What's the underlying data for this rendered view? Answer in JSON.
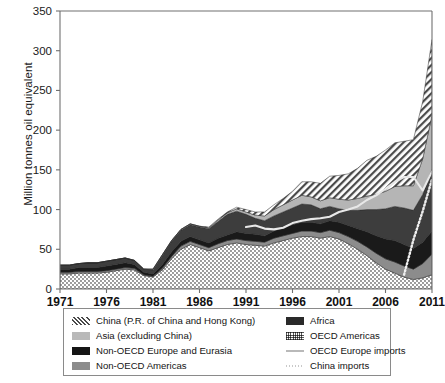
{
  "chart_data": {
    "type": "area",
    "title": "",
    "xlabel": "",
    "ylabel": "Million tonnes oil equivalent",
    "stacked": true,
    "grid": false,
    "legend_position": "bottom",
    "xlim": [
      1971,
      2011
    ],
    "ylim": [
      0,
      350
    ],
    "ytick_labels": [
      "0",
      "50",
      "100",
      "150",
      "200",
      "250",
      "300",
      "350"
    ],
    "yticks": [
      0,
      50,
      100,
      150,
      200,
      250,
      300,
      350
    ],
    "xtick_labels": [
      "1971",
      "1976",
      "1981",
      "1986",
      "1991",
      "1996",
      "2001",
      "2006",
      "2011"
    ],
    "xticks": [
      1971,
      1976,
      1981,
      1986,
      1991,
      1996,
      2001,
      2006,
      2011
    ],
    "x": [
      1971,
      1972,
      1973,
      1974,
      1975,
      1976,
      1977,
      1978,
      1979,
      1980,
      1981,
      1982,
      1983,
      1984,
      1985,
      1986,
      1987,
      1988,
      1989,
      1990,
      1991,
      1992,
      1993,
      1994,
      1995,
      1996,
      1997,
      1998,
      1999,
      2000,
      2001,
      2002,
      2003,
      2004,
      2005,
      2006,
      2007,
      2008,
      2009,
      2010,
      2011
    ],
    "series": [
      {
        "name": "OECD Americas",
        "pattern": "fine-dots",
        "color": "#d9d9d9",
        "values": [
          19,
          19,
          20,
          20,
          20,
          21,
          23,
          25,
          24,
          17,
          15,
          24,
          38,
          50,
          56,
          52,
          48,
          52,
          56,
          58,
          56,
          55,
          54,
          58,
          61,
          64,
          66,
          66,
          64,
          66,
          63,
          57,
          50,
          42,
          33,
          25,
          20,
          15,
          12,
          14,
          18
        ]
      },
      {
        "name": "Non-OECD Americas",
        "pattern": "solid",
        "color": "#8c8c8c",
        "values": [
          2,
          2,
          2,
          2,
          2,
          2,
          2,
          2,
          2,
          1,
          1,
          2,
          3,
          4,
          4,
          4,
          4,
          5,
          5,
          5,
          5,
          5,
          5,
          6,
          6,
          6,
          7,
          7,
          7,
          8,
          8,
          9,
          10,
          11,
          12,
          13,
          14,
          14,
          13,
          18,
          26
        ]
      },
      {
        "name": "Africa",
        "pattern": "solid",
        "color": "#1a1a1a",
        "values": [
          4,
          4,
          5,
          5,
          5,
          6,
          6,
          6,
          5,
          3,
          3,
          5,
          6,
          6,
          6,
          6,
          6,
          7,
          7,
          9,
          9,
          9,
          8,
          9,
          10,
          11,
          11,
          11,
          11,
          12,
          13,
          14,
          16,
          19,
          22,
          25,
          27,
          27,
          26,
          27,
          29
        ]
      },
      {
        "name": "Non-OECD Europe and Eurasia",
        "pattern": "solid",
        "color": "#3d3d3d",
        "values": [
          5,
          5,
          5,
          6,
          6,
          6,
          6,
          6,
          5,
          4,
          5,
          11,
          13,
          14,
          15,
          16,
          18,
          21,
          26,
          26,
          24,
          20,
          19,
          19,
          20,
          21,
          23,
          22,
          19,
          18,
          17,
          19,
          23,
          28,
          33,
          38,
          43,
          46,
          48,
          60,
          78
        ]
      },
      {
        "name": "Asia (excluding China)",
        "pattern": "solid",
        "color": "#b5b5b5",
        "values": [
          0,
          0,
          0,
          0,
          0,
          0,
          0,
          0,
          0,
          0,
          1,
          1,
          1,
          1,
          1,
          1,
          1,
          2,
          2,
          3,
          3,
          4,
          6,
          8,
          9,
          10,
          11,
          10,
          10,
          11,
          12,
          13,
          15,
          17,
          19,
          22,
          25,
          28,
          31,
          45,
          68
        ]
      },
      {
        "name": "China (P.R. of China and Hong Kong)",
        "pattern": "diagonal-hatch",
        "color": "#e0e0e0",
        "values": [
          0,
          0,
          0,
          0,
          0,
          0,
          0,
          0,
          0,
          0,
          0,
          0,
          0,
          0,
          0,
          0,
          1,
          1,
          1,
          2,
          3,
          4,
          5,
          6,
          8,
          11,
          17,
          19,
          22,
          27,
          30,
          33,
          38,
          45,
          48,
          52,
          55,
          56,
          58,
          72,
          95
        ]
      }
    ],
    "lines": [
      {
        "name": "OECD Europe imports",
        "style": "solid",
        "color": "#e8e8e8",
        "values": [
          null,
          null,
          null,
          null,
          null,
          null,
          null,
          null,
          null,
          null,
          null,
          null,
          null,
          null,
          null,
          null,
          null,
          null,
          null,
          null,
          78,
          80,
          76,
          75,
          77,
          83,
          86,
          88,
          89,
          91,
          97,
          100,
          104,
          112,
          118,
          126,
          135,
          141,
          141,
          124,
          148
        ]
      },
      {
        "name": "China imports",
        "style": "dotted",
        "color": "#f0f0f0",
        "values": [
          null,
          null,
          null,
          null,
          null,
          null,
          null,
          null,
          null,
          null,
          null,
          null,
          null,
          null,
          null,
          null,
          null,
          null,
          null,
          null,
          null,
          null,
          null,
          null,
          null,
          null,
          null,
          null,
          null,
          null,
          null,
          null,
          null,
          null,
          null,
          null,
          null,
          18,
          62,
          98,
          138
        ]
      }
    ]
  },
  "legend": {
    "left_items": [
      {
        "label": "China (P.R. of China and Hong Kong)",
        "swatch": "diagonal-hatch"
      },
      {
        "label": "Asia (excluding China)",
        "swatch": "light-gray"
      },
      {
        "label": "Non-OECD Europe and Eurasia",
        "swatch": "black"
      },
      {
        "label": "Non-OECD Americas",
        "swatch": "mid-gray"
      }
    ],
    "right_items": [
      {
        "label": "Africa",
        "swatch": "dark"
      },
      {
        "label": "OECD Americas",
        "swatch": "fine-dots"
      },
      {
        "label": "OECD Europe imports",
        "swatch": "solid-line"
      },
      {
        "label": "China imports",
        "swatch": "dotted-line"
      }
    ]
  }
}
